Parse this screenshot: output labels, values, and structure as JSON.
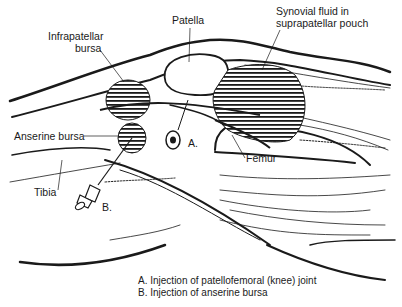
{
  "diagram": {
    "labels": {
      "patella": "Patella",
      "infrapatellar_bursa_line1": "Infrapatellar",
      "infrapatellar_bursa_line2": "bursa",
      "synovial_line1": "Synovial fluid in",
      "synovial_line2": "suprapatellar pouch",
      "anserine_bursa": "Anserine bursa",
      "tibia": "Tibia",
      "femur": "Femur",
      "marker_a": "A.",
      "marker_b": "B."
    },
    "caption": {
      "line_a": "A. Injection of patellofemoral (knee) joint",
      "line_b": "B. Injection of anserine bursa"
    },
    "colors": {
      "ink": "#1a1a1a",
      "background": "#ffffff"
    }
  }
}
